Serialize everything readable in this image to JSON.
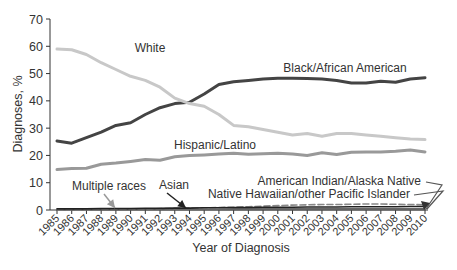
{
  "chart_data": {
    "type": "line",
    "title": "",
    "xlabel": "Year of Diagnosis",
    "ylabel": "Diagnoses, %",
    "ylim": [
      0,
      70
    ],
    "yticks": [
      0,
      10,
      20,
      30,
      40,
      50,
      60,
      70
    ],
    "grid": false,
    "legend": "inline labels",
    "x": [
      1985,
      1986,
      1987,
      1988,
      1989,
      1990,
      1991,
      1992,
      1993,
      1994,
      1995,
      1996,
      1997,
      1998,
      1999,
      2000,
      2001,
      2002,
      2003,
      2004,
      2005,
      2006,
      2007,
      2008,
      2009,
      2010
    ],
    "series": [
      {
        "name": "White",
        "color": "#c8c8c8",
        "values": [
          59,
          58.7,
          57,
          54,
          51.5,
          49,
          47.5,
          45,
          41,
          39,
          38,
          35,
          31,
          30.5,
          29.5,
          28.5,
          27.5,
          28,
          27,
          28,
          28,
          27.5,
          27,
          26.5,
          26,
          25.8
        ]
      },
      {
        "name": "Black/African American",
        "color": "#444444",
        "values": [
          25.3,
          24.5,
          26.5,
          28.5,
          31,
          32,
          35,
          37.5,
          39,
          39.5,
          42.5,
          46,
          47,
          47.5,
          48,
          48.3,
          48.3,
          48.2,
          48,
          47.5,
          46.5,
          46.5,
          47.2,
          46.8,
          48,
          48.5
        ]
      },
      {
        "name": "Hispanic/Latino",
        "color": "#999999",
        "values": [
          14.8,
          15.2,
          15.3,
          16.8,
          17.2,
          17.8,
          18.5,
          18.2,
          19.5,
          20,
          20.2,
          20.5,
          20.8,
          20.4,
          20.6,
          20.8,
          20.5,
          20,
          21,
          20.3,
          21.2,
          21.3,
          21.3,
          21.5,
          22,
          21.3
        ]
      },
      {
        "name": "Asian",
        "color": "#222222",
        "values": [
          0.4,
          0.4,
          0.4,
          0.5,
          0.5,
          0.5,
          0.6,
          0.6,
          0.7,
          0.7,
          0.8,
          0.8,
          0.9,
          0.9,
          1.0,
          1.0,
          1.0,
          1.1,
          1.1,
          1.1,
          1.2,
          1.2,
          1.2,
          1.2,
          1.3,
          1.3
        ]
      },
      {
        "name": "Multiple races",
        "color": "#888888",
        "values": [
          0.2,
          0.2,
          0.2,
          0.3,
          0.3,
          0.3,
          0.4,
          0.5,
          0.6,
          0.7,
          0.8,
          0.9,
          1.0,
          1.2,
          1.4,
          1.6,
          1.8,
          1.9,
          2.0,
          2.0,
          2.1,
          2.2,
          2.2,
          2.1,
          2.0,
          1.9
        ]
      },
      {
        "name": "American Indian/Alaska Native",
        "color": "#666666",
        "values": [
          0.2,
          0.2,
          0.2,
          0.2,
          0.2,
          0.3,
          0.3,
          0.3,
          0.3,
          0.3,
          0.3,
          0.3,
          0.4,
          0.4,
          0.4,
          0.4,
          0.4,
          0.4,
          0.4,
          0.4,
          0.4,
          0.4,
          0.4,
          0.4,
          0.4,
          0.4
        ]
      },
      {
        "name": "Native Hawaiian/other Pacific Islander",
        "color": "#555555",
        "values": [
          0.1,
          0.1,
          0.1,
          0.1,
          0.1,
          0.1,
          0.1,
          0.1,
          0.1,
          0.1,
          0.1,
          0.1,
          0.1,
          0.1,
          0.1,
          0.1,
          0.1,
          0.1,
          0.1,
          0.1,
          0.1,
          0.1,
          0.1,
          0.1,
          0.1,
          0.1
        ]
      }
    ],
    "annotations": [
      {
        "text": "White",
        "x": 150,
        "y": 52,
        "anchor": "middle"
      },
      {
        "text": "Black/African American",
        "x": 345,
        "y": 72,
        "anchor": "middle"
      },
      {
        "text": "Hispanic/Latino",
        "x": 215,
        "y": 149,
        "anchor": "middle"
      },
      {
        "text": "Multiple races",
        "x": 109,
        "y": 190,
        "anchor": "middle"
      },
      {
        "text": "Asian",
        "x": 174,
        "y": 189,
        "anchor": "middle"
      },
      {
        "text": "American Indian/Alaska Native",
        "x": 421,
        "y": 185,
        "anchor": "end"
      },
      {
        "text": "Native Hawaiian/other Pacific Islander",
        "x": 410,
        "y": 198,
        "anchor": "end"
      }
    ]
  }
}
